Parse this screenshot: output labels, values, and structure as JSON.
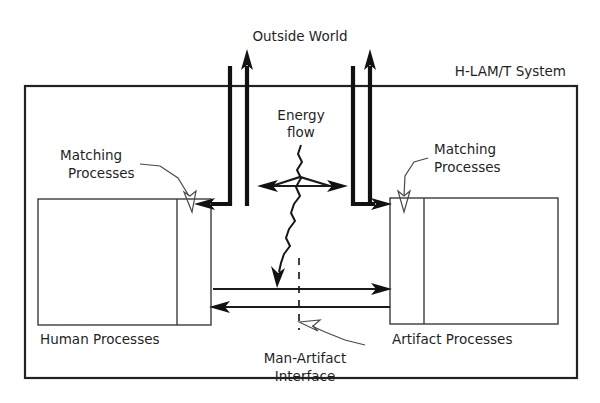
{
  "diagram": {
    "outside_world_label": "Outside World",
    "frame_label": "H-LAM/T System",
    "energy_flow_label_line1": "Energy",
    "energy_flow_label_line2": "flow",
    "matching_left_line1": "Matching",
    "matching_left_line2": "Processes",
    "matching_right_line1": "Matching",
    "matching_right_line2": "Processes",
    "human_box_caption": "Human Processes",
    "artifact_box_caption": "Artifact Processes",
    "interface_label_line1": "Man-Artifact",
    "interface_label_line2": "Interface",
    "colors": {
      "background": "#ffffff",
      "text": "#1f1f1f",
      "frame_stroke": "#222222",
      "box_stroke": "#3b3b3b",
      "flow_stroke": "#111111",
      "leader_stroke": "#4a4a4a",
      "dashed_stroke": "#2a2a2a"
    },
    "elements": {
      "human_box": {
        "x": 38,
        "y": 199,
        "width": 173,
        "height": 126,
        "divider_x": 177
      },
      "artifact_box": {
        "x": 390,
        "y": 198,
        "width": 168,
        "height": 126,
        "divider_x": 424
      },
      "system_frame": {
        "x": 25,
        "y": 86,
        "width": 552,
        "height": 292
      },
      "interface_dashed_line": {
        "x": 299,
        "y1": 258,
        "y2": 330
      },
      "mid_arrow_right_y": 289,
      "mid_arrow_left_y": 307
    }
  }
}
